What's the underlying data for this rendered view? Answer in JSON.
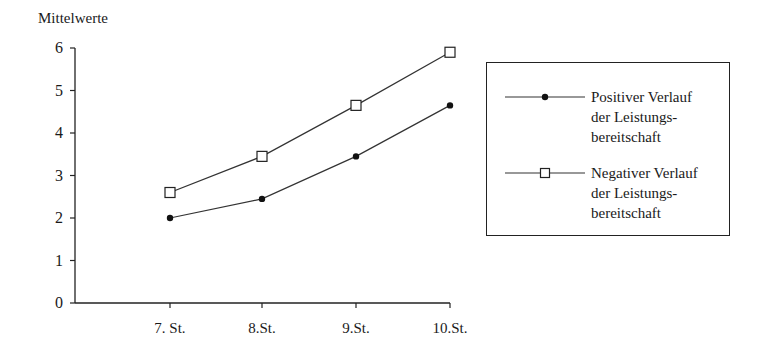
{
  "chart_data": {
    "type": "line",
    "title": "",
    "xlabel": "",
    "ylabel": "Mittelwerte",
    "ylim": [
      0,
      6
    ],
    "yticks": [
      0,
      1,
      2,
      3,
      4,
      5,
      6
    ],
    "categories": [
      "7. St.",
      "8.St.",
      "9.St.",
      "10.St."
    ],
    "grid": false,
    "legend_position": "right",
    "series": [
      {
        "name": "Positiver Verlauf der Leistungsbereitschaft",
        "name_lines": [
          "Positiver Verlauf",
          "der Leistungs-",
          "bereitschaft"
        ],
        "marker": "filled-circle",
        "values": [
          2.0,
          2.45,
          3.45,
          4.65
        ]
      },
      {
        "name": "Negativer Verlauf der Leistungsbereitschaft",
        "name_lines": [
          "Negativer Verlauf",
          "der Leistungs-",
          "bereitschaft"
        ],
        "marker": "open-square",
        "values": [
          2.6,
          3.45,
          4.65,
          5.9
        ]
      }
    ]
  },
  "colors": {
    "line": "#333333",
    "axis": "#222222",
    "background": "#ffffff"
  }
}
